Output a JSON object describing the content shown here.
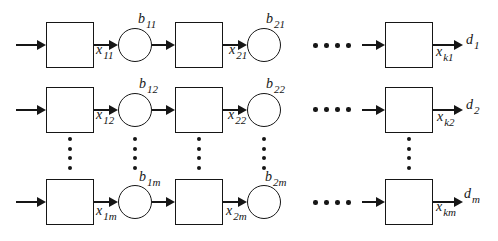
{
  "colors": {
    "ink": "#161616",
    "bg": "#ffffff"
  },
  "labels": {
    "x11": {
      "main": "x",
      "sub": "11"
    },
    "b11": {
      "main": "b",
      "sub": "11"
    },
    "x21": {
      "main": "x",
      "sub": "21"
    },
    "b21": {
      "main": "b",
      "sub": "21"
    },
    "xk1": {
      "main": "x",
      "sub": "k1"
    },
    "d1": {
      "main": "d",
      "sub": "1"
    },
    "x12": {
      "main": "x",
      "sub": "12"
    },
    "b12": {
      "main": "b",
      "sub": "12"
    },
    "x22": {
      "main": "x",
      "sub": "22"
    },
    "b22": {
      "main": "b",
      "sub": "22"
    },
    "xk2": {
      "main": "x",
      "sub": "k2"
    },
    "d2": {
      "main": "d",
      "sub": "2"
    },
    "x1m": {
      "main": "x",
      "sub": "1m"
    },
    "b1m": {
      "main": "b",
      "sub": "1m"
    },
    "x2m": {
      "main": "x",
      "sub": "2m"
    },
    "b2m": {
      "main": "b",
      "sub": "2m"
    },
    "xkm": {
      "main": "x",
      "sub": "km"
    },
    "dm": {
      "main": "d",
      "sub": "m"
    }
  }
}
